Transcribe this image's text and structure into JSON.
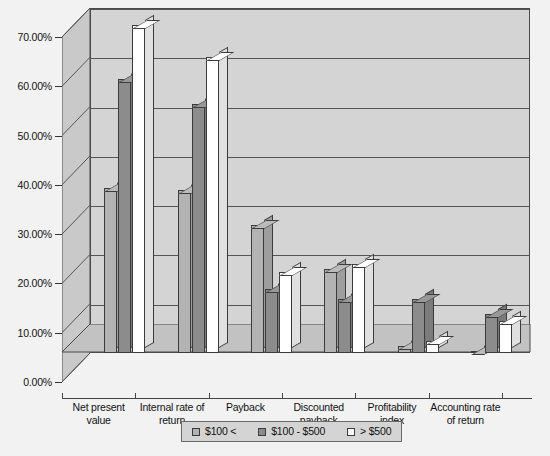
{
  "chart_data": {
    "type": "bar",
    "title": "",
    "subtitle": "",
    "xlabel": "",
    "ylabel": "",
    "ylim": [
      0,
      70
    ],
    "ytick_labels": [
      "0.00%",
      "10.00%",
      "20.00%",
      "30.00%",
      "40.00%",
      "50.00%",
      "60.00%",
      "70.00%"
    ],
    "ytick_values": [
      0,
      10,
      20,
      30,
      40,
      50,
      60,
      70
    ],
    "grid": true,
    "legend_position": "bottom",
    "three_d": true,
    "categories": [
      "Net present value",
      "Internal rate of return",
      "Payback",
      "Discounted payback",
      "Profitability index",
      "Accounting rate of return"
    ],
    "series": [
      {
        "name": "$100 <",
        "color": "#b3b3b3",
        "values": [
          33.5,
          33.0,
          26.0,
          17.0,
          1.5,
          0.5
        ]
      },
      {
        "name": "$100 - $500",
        "color": "#8c8c8c",
        "values": [
          55.5,
          50.5,
          13.0,
          11.0,
          11.0,
          8.0
        ]
      },
      {
        "name": "> $500",
        "color": "#ffffff",
        "values": [
          66.5,
          60.0,
          16.5,
          18.0,
          2.5,
          6.5
        ]
      }
    ]
  },
  "legend": {
    "items": [
      {
        "label": "$100 <",
        "swatch_name": "legend-swatch-under-100"
      },
      {
        "label": "$100 - $500",
        "swatch_name": "legend-swatch-100-500"
      },
      {
        "label": "> $500",
        "swatch_name": "legend-swatch-over-500"
      }
    ]
  },
  "colors": {
    "background": "#f2f2f2",
    "plot_wall": "#d4d4d4",
    "plot_floor": "#c2c2c2",
    "axis": "#333333",
    "series_1": "#b3b3b3",
    "series_2": "#8c8c8c",
    "series_3": "#ffffff"
  }
}
